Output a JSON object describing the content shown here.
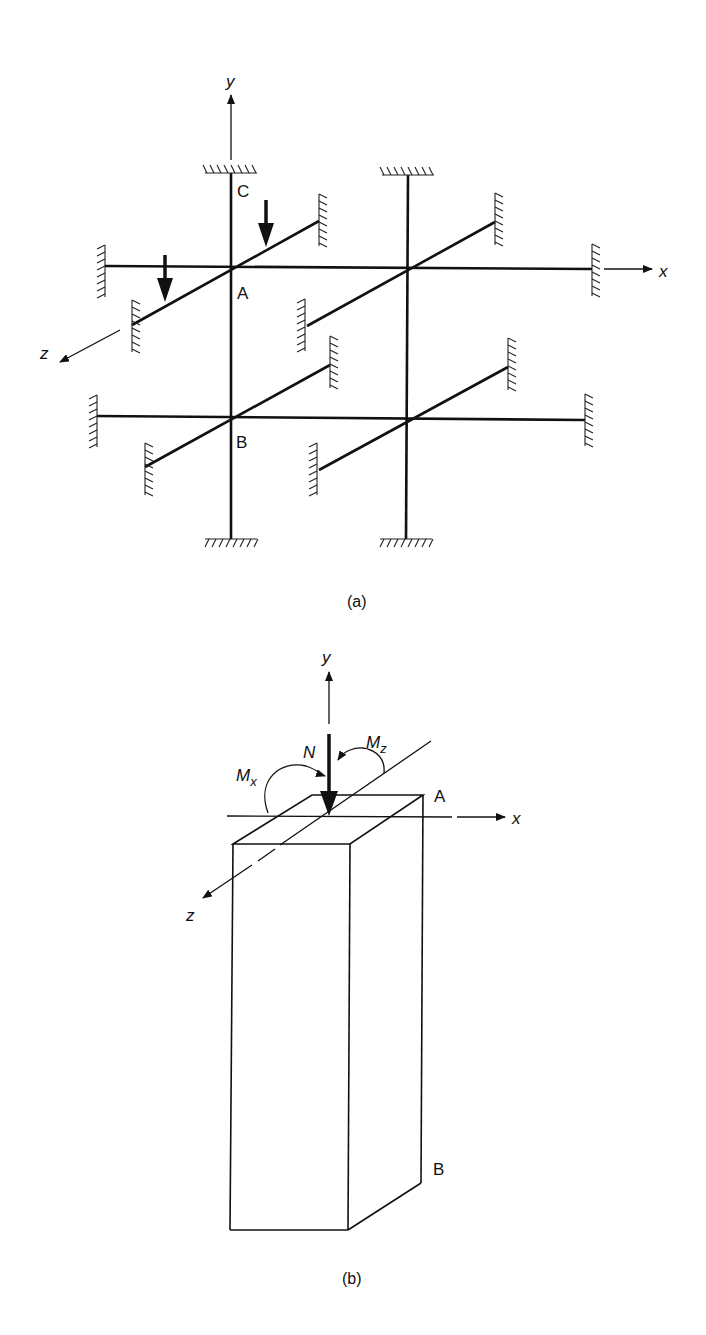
{
  "figure": {
    "panel_a": {
      "caption": "(a)",
      "axes": {
        "x": "x",
        "y": "y",
        "z": "z"
      },
      "nodes": {
        "A": "A",
        "B": "B",
        "C": "C"
      },
      "description": "3D frame with two columns, two floor levels, beams in x and z directions, fixed supports at all ends, two downward point loads on z-beam near A"
    },
    "panel_b": {
      "caption": "(b)",
      "axes": {
        "x": "x",
        "y": "y",
        "z": "z"
      },
      "corners": {
        "A": "A",
        "B": "B"
      },
      "loads": {
        "N": "N",
        "Mx": "M",
        "Mx_sub": "x",
        "Mz": "M",
        "Mz_sub": "z"
      },
      "description": "Rectangular column section with axial force N and biaxial moments Mx, Mz"
    }
  },
  "colors": {
    "line": "#111111",
    "background": "#ffffff"
  }
}
